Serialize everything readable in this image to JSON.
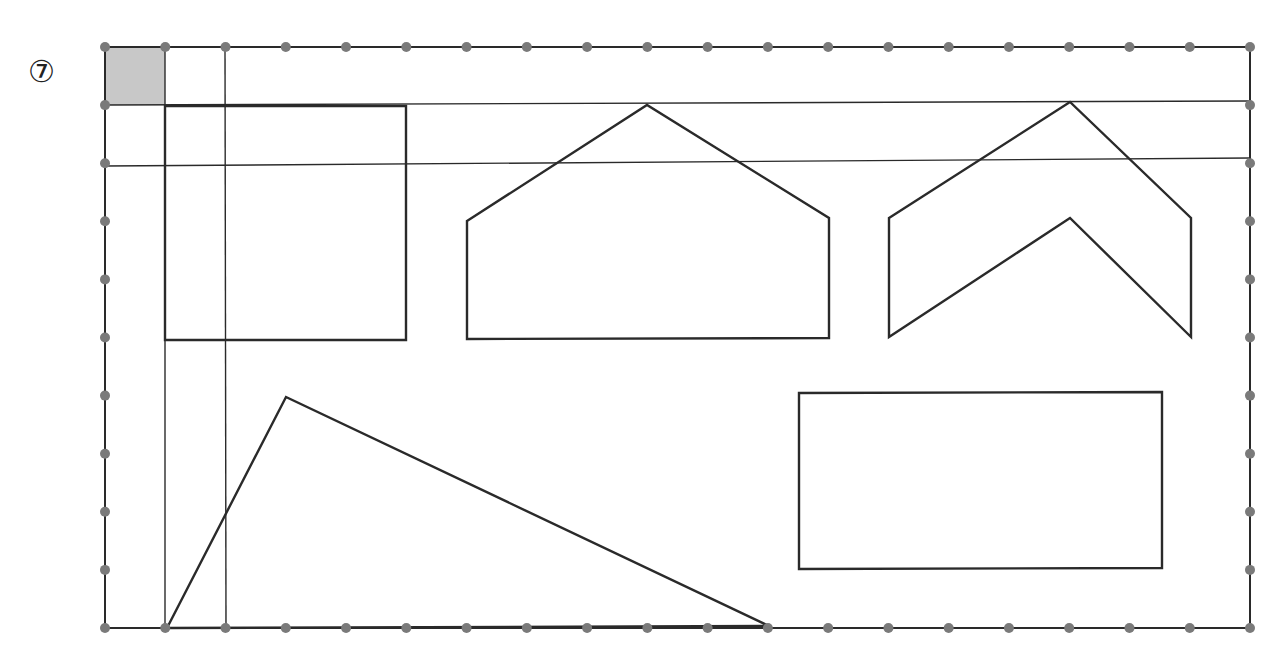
{
  "problem_number": "⑦",
  "grid": {
    "cols": 19,
    "rows": 10,
    "x0": 105,
    "y0": 47,
    "x1": 1250,
    "y1": 628,
    "dot_color": "#7a7a7a",
    "line_color": "#2a2a2a"
  },
  "unit_square": {
    "x": 105,
    "y": 47,
    "w": 60,
    "h": 58,
    "fill": "#c8c8c8"
  },
  "guide_lines": {
    "horizontal": [
      [
        105,
        105,
        1250,
        101
      ],
      [
        105,
        166,
        1250,
        158
      ]
    ],
    "vertical": [
      [
        165,
        47,
        165,
        628
      ],
      [
        225,
        47,
        226,
        628
      ]
    ]
  },
  "shapes": [
    {
      "name": "square",
      "points": [
        [
          165,
          106
        ],
        [
          406,
          106
        ],
        [
          406,
          340
        ],
        [
          165,
          340
        ]
      ]
    },
    {
      "name": "pentagon-house",
      "points": [
        [
          467,
          221
        ],
        [
          647,
          105
        ],
        [
          829,
          218
        ],
        [
          829,
          338
        ],
        [
          467,
          339
        ]
      ]
    },
    {
      "name": "chevron",
      "points": [
        [
          889,
          218
        ],
        [
          1070,
          102
        ],
        [
          1191,
          218
        ],
        [
          1191,
          337
        ],
        [
          1070,
          218
        ],
        [
          889,
          337
        ]
      ]
    },
    {
      "name": "triangle",
      "points": [
        [
          167,
          628
        ],
        [
          286,
          397
        ],
        [
          769,
          626
        ]
      ]
    },
    {
      "name": "rectangle",
      "points": [
        [
          799,
          393
        ],
        [
          1162,
          392
        ],
        [
          1162,
          568
        ],
        [
          799,
          569
        ]
      ]
    }
  ]
}
